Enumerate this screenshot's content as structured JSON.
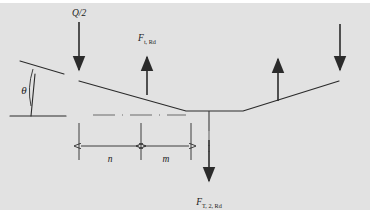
{
  "figure": {
    "panel_color": "#e2e2e2",
    "line_color": "#2b2b2b",
    "background_color": "#ffffff"
  },
  "labels": {
    "load_q": "Q/2",
    "force_t_rd": "F",
    "force_t_rd_sub": "t, Rd",
    "force_t2_rd": "F",
    "force_t2_rd_sub": "T, 2, Rd",
    "angle_theta": "θ",
    "dim_n": "n",
    "dim_m": "m"
  },
  "geometry": {
    "panel": {
      "x": 0,
      "y": 3,
      "width": 370,
      "height": 207
    },
    "beam_points": "79,81 186,111 243,111 339,81",
    "angle_indicator": {
      "vertical_line": {
        "x1": 35,
        "y1": 74,
        "x2": 31,
        "y2": 116
      },
      "baseline": {
        "x1": 10,
        "y1": 116,
        "x2": 66,
        "y2": 116
      },
      "inclined_line": {
        "x1": 20,
        "y1": 61,
        "x2": 64,
        "y2": 74
      }
    },
    "centerline_horizontal": {
      "x1": 93,
      "y1": 115,
      "x2": 186,
      "y2": 115
    },
    "centerline_vertical": {
      "x1": 209,
      "y1": 114,
      "x2": 209,
      "y2": 152
    },
    "stem_vertical": {
      "x1": 209,
      "y1": 111,
      "x2": 209,
      "y2": 130
    }
  },
  "arrows": [
    {
      "name": "load-q-arrow",
      "direction": "down",
      "x": 79,
      "y_start": 22,
      "y_end": 79,
      "label": "Q/2"
    },
    {
      "name": "force-t-rd-arrow",
      "direction": "up",
      "x": 147,
      "y_start": 95,
      "y_end": 48,
      "label": "F t, Rd"
    },
    {
      "name": "force-right-up-arrow",
      "direction": "up",
      "x": 278,
      "y_start": 101,
      "y_end": 50,
      "label": ""
    },
    {
      "name": "force-right-down-arrow",
      "direction": "down",
      "x": 340,
      "y_start": 24,
      "y_end": 79,
      "label": ""
    },
    {
      "name": "force-t2-rd-arrow",
      "direction": "down",
      "x": 209,
      "y_start": 140,
      "y_end": 190,
      "label": "F T, 2, Rd"
    }
  ],
  "dimensions": {
    "extension_lines": [
      {
        "x": 79,
        "y1": 123,
        "y2": 160
      },
      {
        "x": 141,
        "y1": 123,
        "y2": 160
      },
      {
        "x": 191,
        "y1": 123,
        "y2": 160
      }
    ],
    "dim_line_y": 146,
    "segments": [
      {
        "label": "n",
        "x1": 79,
        "x2": 141,
        "label_x": 110,
        "label_y": 161
      },
      {
        "label": "m",
        "x1": 141,
        "x2": 191,
        "label_x": 166,
        "label_y": 161
      }
    ]
  }
}
